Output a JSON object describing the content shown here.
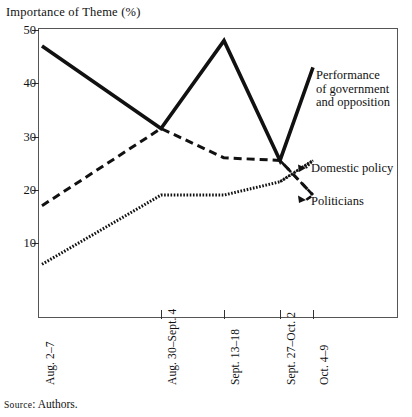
{
  "figure": {
    "axis_title": "Importance of Theme (%)",
    "source_prefix": "Source",
    "source_separator": ":",
    "source_value": "Authors."
  },
  "chart_data": {
    "type": "line",
    "title": "Importance of Theme (%)",
    "xlabel": "",
    "ylabel": "Importance of Theme (%)",
    "ylim": [
      0,
      50
    ],
    "yticks": [
      10,
      20,
      30,
      40,
      50
    ],
    "grid": false,
    "legend": "inline-right-annotations",
    "categories": [
      "Aug. 2–7",
      "Aug. 30–Sept. 4",
      "Sept. 13–18",
      "Sept. 27–Oct. 2",
      "Oct. 4–9"
    ],
    "series": [
      {
        "name": "Performance of government and opposition",
        "style": "solid",
        "values": [
          47,
          31.5,
          48,
          25.5,
          43
        ]
      },
      {
        "name": "Domestic policy",
        "style": "dashed",
        "values": [
          17,
          31.5,
          26,
          25.5,
          19
        ]
      },
      {
        "name": "Politicians",
        "style": "dotted",
        "values": [
          6,
          19,
          19,
          21.5,
          25.5
        ]
      }
    ],
    "annotations": [
      {
        "text": "Performance of government and opposition",
        "target_series": "Performance of government and opposition"
      },
      {
        "text": "Domestic policy",
        "target_series": "Domestic policy"
      },
      {
        "text": "Politicians",
        "target_series": "Politicians"
      }
    ]
  },
  "axes": {
    "y_tick_labels": [
      "50",
      "40",
      "30",
      "20",
      "10"
    ],
    "x_tick_labels": [
      "Aug. 2–7",
      "Aug. 30–Sept. 4",
      "Sept. 13–18",
      "Sept. 27–Oct. 2",
      "Oct. 4–9"
    ]
  },
  "series_labels": {
    "performance_line1": "Performance",
    "performance_line2": "of government",
    "performance_line3": "and opposition",
    "domestic_policy": "Domestic policy",
    "politicians": "Politicians"
  },
  "colors": {
    "ink": "#111111",
    "frame": "#555555",
    "background": "#ffffff"
  }
}
